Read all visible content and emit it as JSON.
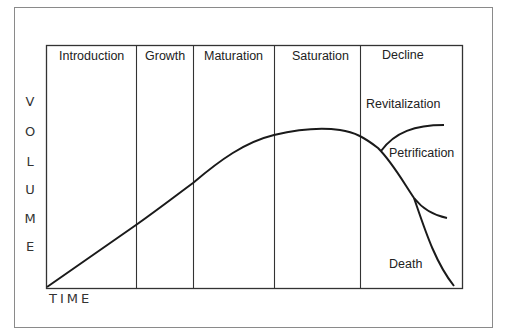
{
  "diagram": {
    "type": "product-life-cycle",
    "y_axis_label": "VOLUME",
    "y_axis_letters": [
      "V",
      "O",
      "L",
      "U",
      "M",
      "E"
    ],
    "x_axis_label": "TIME",
    "stages": [
      {
        "label": "Introduction"
      },
      {
        "label": "Growth"
      },
      {
        "label": "Maturation"
      },
      {
        "label": "Saturation"
      },
      {
        "label": "Decline"
      }
    ],
    "branches": {
      "revitalization": "Revitalization",
      "petrification": "Petrification",
      "death": "Death"
    },
    "colors": {
      "line": "#1a1a1a",
      "frame": "#333333",
      "outer_border": "#8a8a8a",
      "text": "#222222"
    }
  }
}
